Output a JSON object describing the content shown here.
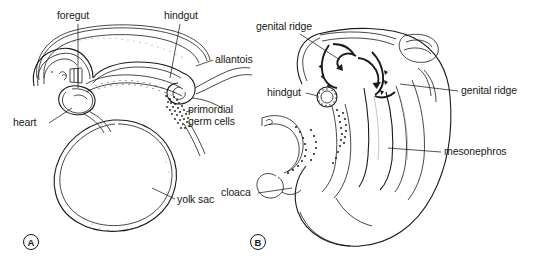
{
  "figure": {
    "background_color": "#ffffff",
    "ink_color": "#1a1a1a",
    "panels": [
      {
        "tag": "A",
        "name": "panel-a",
        "description": "Sagittal view of early embryo with yolk sac",
        "labels": [
          {
            "id": "foregut",
            "text": "foregut"
          },
          {
            "id": "hindgut",
            "text": "hindgut"
          },
          {
            "id": "allantois",
            "text": "allantois"
          },
          {
            "id": "heart",
            "text": "heart"
          },
          {
            "id": "pgc",
            "text": "primordial\ngerm cells"
          },
          {
            "id": "yolk_sac",
            "text": "yolk sac"
          }
        ]
      },
      {
        "tag": "B",
        "name": "panel-b",
        "description": "Later embryo showing germ cell migration into genital ridges",
        "labels": [
          {
            "id": "genital_ridge_left",
            "text": "genital ridge"
          },
          {
            "id": "genital_ridge_right",
            "text": "genital ridge"
          },
          {
            "id": "hindgut_b",
            "text": "hindgut"
          },
          {
            "id": "mesonephros",
            "text": "mesonephros"
          },
          {
            "id": "cloaca",
            "text": "cloaca"
          }
        ]
      }
    ]
  },
  "panel_a": {
    "tag": "A",
    "foregut": "foregut",
    "hindgut": "hindgut",
    "allantois": "allantois",
    "heart": "heart",
    "primordial_germ_cells": "primordial\ngerm cells",
    "yolk_sac": "yolk sac"
  },
  "panel_b": {
    "tag": "B",
    "genital_ridge_left": "genital ridge",
    "genital_ridge_right": "genital ridge",
    "hindgut": "hindgut",
    "mesonephros": "mesonephros",
    "cloaca": "cloaca"
  }
}
